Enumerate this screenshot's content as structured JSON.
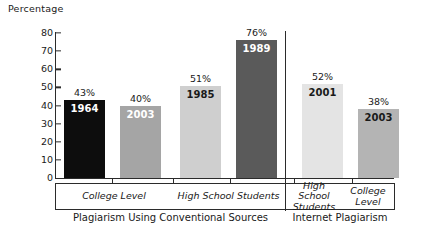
{
  "chart_data": {
    "type": "bar",
    "title": "",
    "ylabel": "Percentage",
    "xlabel": "",
    "ylim": [
      0,
      80
    ],
    "yticks": [
      0,
      10,
      20,
      30,
      40,
      50,
      60,
      70,
      80
    ],
    "grid": false,
    "legend": "none",
    "categories": [
      "College Level",
      "High School Students",
      "High School Students",
      "College Level"
    ],
    "bars": [
      {
        "year": "1964",
        "value": 43,
        "pct_label": "43%",
        "group": "Plagiarism Using Conventional Sources",
        "category": "College Level",
        "color": "#0d0d0d",
        "label_color": "#ffffff"
      },
      {
        "year": "2003",
        "value": 40,
        "pct_label": "40%",
        "group": "Plagiarism Using Conventional Sources",
        "category": "College Level",
        "color": "#a5a5a5",
        "label_color": "#ffffff"
      },
      {
        "year": "1985",
        "value": 51,
        "pct_label": "51%",
        "group": "Plagiarism Using Conventional Sources",
        "category": "High School Students",
        "color": "#cfcfcf",
        "label_color": "#1a1a1a"
      },
      {
        "year": "1989",
        "value": 76,
        "pct_label": "76%",
        "group": "Plagiarism Using Conventional Sources",
        "category": "High School Students",
        "color": "#5a5a5a",
        "label_color": "#ffffff"
      },
      {
        "year": "2001",
        "value": 52,
        "pct_label": "52%",
        "group": "Internet Plagiarism",
        "category": "High School Students",
        "color": "#e4e4e4",
        "label_color": "#1a1a1a"
      },
      {
        "year": "2003",
        "value": 38,
        "pct_label": "38%",
        "group": "Internet Plagiarism",
        "category": "College Level",
        "color": "#b4b4b4",
        "label_color": "#1a1a1a"
      }
    ],
    "group_captions": [
      "Plagiarism Using Conventional Sources",
      "Internet Plagiarism"
    ],
    "axis_label_lines": [
      [
        "College Level"
      ],
      [
        "High School Students"
      ],
      [
        "High School",
        "Students"
      ],
      [
        "College",
        "Level"
      ]
    ]
  },
  "yticklabels": {
    "t0": "0",
    "t10": "10",
    "t20": "20",
    "t30": "30",
    "t40": "40",
    "t50": "50",
    "t60": "60",
    "t70": "70",
    "t80": "80"
  },
  "ylabel": "Percentage",
  "bar_pct": {
    "b0": "43%",
    "b1": "40%",
    "b2": "51%",
    "b3": "76%",
    "b4": "52%",
    "b5": "38%"
  },
  "bar_year": {
    "b0": "1964",
    "b1": "2003",
    "b2": "1985",
    "b3": "1989",
    "b4": "2001",
    "b5": "2003"
  },
  "axis_labels": {
    "g1c1": "College Level",
    "g1c2": "High School Students",
    "g2c1_l1": "High School",
    "g2c1_l2": "Students",
    "g2c2_l1": "College",
    "g2c2_l2": "Level"
  },
  "captions": {
    "left": "Plagiarism Using Conventional Sources",
    "right": "Internet Plagiarism"
  }
}
